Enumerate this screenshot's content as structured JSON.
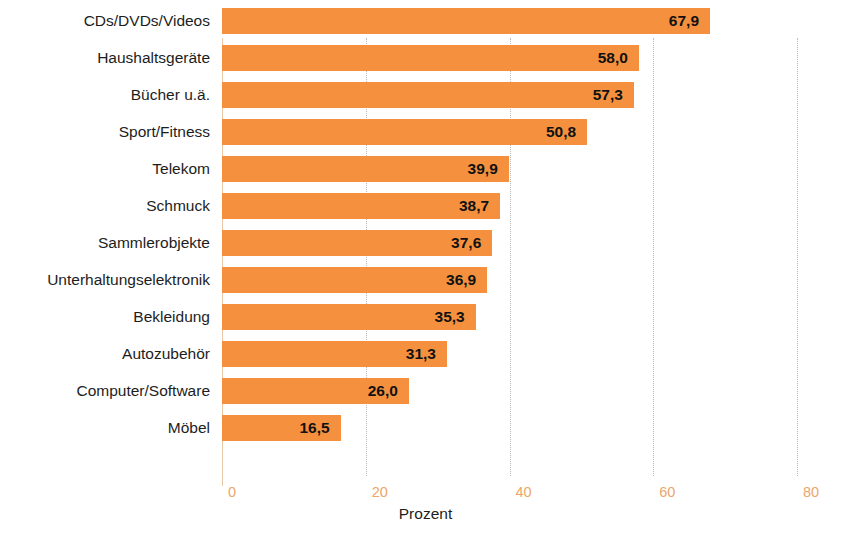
{
  "chart_data": {
    "type": "bar",
    "orientation": "horizontal",
    "title": "",
    "xlabel": "Prozent",
    "ylabel": "",
    "xlim": [
      0,
      80
    ],
    "xticks": [
      0,
      20,
      40,
      60,
      80
    ],
    "xtick_labels": [
      "0",
      "20",
      "40",
      "60",
      "80"
    ],
    "grid": true,
    "legend": null,
    "categories": [
      "CDs/DVDs/Videos",
      "Haushaltsgeräte",
      "Bücher u.ä.",
      "Sport/Fitness",
      "Telekom",
      "Schmuck",
      "Sammlerobjekte",
      "Unterhaltungselektronik",
      "Bekleidung",
      "Autozubehör",
      "Computer/Software",
      "Möbel"
    ],
    "values": [
      67.9,
      58.0,
      57.3,
      50.8,
      39.9,
      38.7,
      37.6,
      36.9,
      35.3,
      31.3,
      26.0,
      16.5
    ],
    "value_labels": [
      "67,9",
      "58,0",
      "57,3",
      "50,8",
      "39,9",
      "38,7",
      "37,6",
      "36,9",
      "35,3",
      "31,3",
      "26,0",
      "16,5"
    ],
    "bar_color": "#F5913E",
    "value_label_color": "#111111",
    "tick_label_color": "#EDA56A",
    "gridline_color": "#B9B9B9",
    "axis_line_color": "#E9C9A8"
  }
}
